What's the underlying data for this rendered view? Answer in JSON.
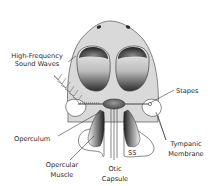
{
  "figure": {
    "labels": {
      "high_frequency_line1": "High-Frequency",
      "high_frequency_line2": "Sound Waves",
      "stapes": "Stapes",
      "operculum": "Operculum",
      "opercular_muscle_line1": "Opercular",
      "opercular_muscle_line2": "Muscle",
      "otic_capsule_line1": "Otic",
      "otic_capsule_line2": "Capsule",
      "ss": "SS",
      "tympanic_membrane_line1": "Tympanic",
      "tympanic_membrane_line2": "Membrane"
    },
    "colors": {
      "head_fill": "#d9d9d9",
      "outline": "#555555",
      "eye_dark": "#3a3a3a",
      "label_text": "#2a2a2a",
      "background": "#ffffff"
    }
  }
}
